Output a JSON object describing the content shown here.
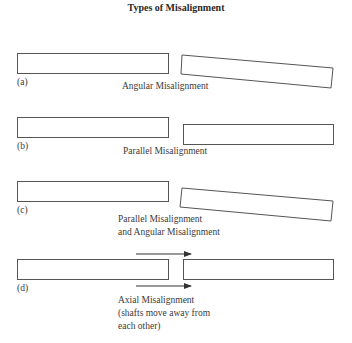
{
  "title": "Types of Misalignment",
  "panels": [
    {
      "id": "a",
      "letter": "(a)",
      "caption": [
        "Angular Misalignment"
      ]
    },
    {
      "id": "b",
      "letter": "(b)",
      "caption": [
        "Parallel Misalignment"
      ]
    },
    {
      "id": "c",
      "letter": "(c)",
      "caption": [
        "Parallel Misalignment",
        "and Angular Misalignment"
      ]
    },
    {
      "id": "d",
      "letter": "(d)",
      "caption": [
        "Axial Misalignment",
        "(shafts move away from",
        "each other)"
      ]
    }
  ],
  "colors": {
    "stroke": "#555555",
    "text": "#333333"
  }
}
